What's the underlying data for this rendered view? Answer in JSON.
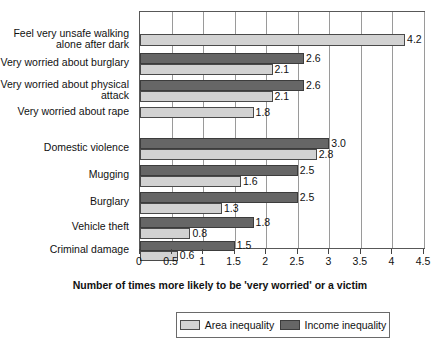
{
  "chart_data": {
    "type": "bar",
    "orientation": "horizontal",
    "title": "",
    "xlabel": "Number of times more likely to be 'very worried' or a victim",
    "ylabel": "",
    "xlim": [
      0,
      4.5
    ],
    "grid": true,
    "legend_position": "bottom",
    "tick_labels": [
      "0",
      "0.5",
      "1",
      "1.5",
      "2",
      "2.5",
      "3",
      "3.5",
      "4",
      "4.5"
    ],
    "tick_values": [
      0,
      0.5,
      1,
      1.5,
      2,
      2.5,
      3,
      3.5,
      4,
      4.5
    ],
    "series": [
      {
        "name": "Area inequality",
        "color": "#d2d2d2",
        "values": [
          4.2,
          2.1,
          2.1,
          1.8,
          2.8,
          1.6,
          1.3,
          0.8,
          0.6
        ]
      },
      {
        "name": "Income inequality",
        "color": "#666666",
        "values": [
          null,
          2.6,
          2.6,
          null,
          3.0,
          2.5,
          2.5,
          1.8,
          1.5
        ]
      }
    ],
    "categories": [
      "Feel very unsafe walking alone after dark",
      "Very worried about burglary",
      "Very worried about physical attack",
      "Very worried about rape",
      "Domestic violence",
      "Mugging",
      "Burglary",
      "Vehicle theft",
      "Criminal damage"
    ],
    "category_labels_display": [
      "Feel very unsafe walking\nalone after dark",
      "Very worried about burglary",
      "Very worried about physical\nattack",
      "Very worried about rape",
      "Domestic violence",
      "Mugging",
      "Burglary",
      "Vehicle theft",
      "Criminal damage"
    ],
    "data_labels": {
      "area": [
        "4.2",
        "2.1",
        "2.1",
        "1.8",
        "2.8",
        "1.6",
        "1.3",
        "0.8",
        "0.6"
      ],
      "income": [
        "",
        "2.6",
        "2.6",
        "",
        "3.0",
        "2.5",
        "2.5",
        "1.8",
        "1.5"
      ]
    }
  },
  "legend": {
    "entries": [
      {
        "label": "Area inequality",
        "color": "#d2d2d2"
      },
      {
        "label": "Income inequality",
        "color": "#666666"
      }
    ]
  },
  "axis": {
    "title": "Number of times more likely to be 'very worried' or a victim"
  }
}
